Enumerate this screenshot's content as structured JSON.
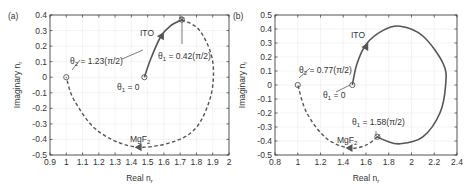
{
  "chart_data": [
    {
      "panel": "(a)",
      "type": "line",
      "xlabel": "Real n_r",
      "ylabel": "Imaginary n_r",
      "xlim": [
        0.9,
        2.0
      ],
      "ylim": [
        -0.5,
        0.4
      ],
      "xticks": [
        "0.9",
        "1",
        "1.1",
        "1.2",
        "1.3",
        "1.4",
        "1.5",
        "1.6",
        "1.7",
        "1.8",
        "1.9",
        "2"
      ],
      "yticks": [
        "0.4",
        "0.3",
        "0.2",
        "0.1",
        "0",
        "-0.1",
        "-0.2",
        "-0.3",
        "-0.4",
        "-0.5"
      ],
      "grid": true,
      "series": [
        {
          "name": "ITO",
          "style": "solid",
          "points": [
            [
              1.48,
              0.0
            ],
            [
              1.52,
              0.12
            ],
            [
              1.58,
              0.26
            ],
            [
              1.64,
              0.33
            ],
            [
              1.71,
              0.37
            ]
          ]
        },
        {
          "name": "MgF2",
          "style": "dashed",
          "points": [
            [
              1.71,
              0.37
            ],
            [
              1.82,
              0.3
            ],
            [
              1.9,
              0.1
            ],
            [
              1.88,
              -0.15
            ],
            [
              1.75,
              -0.37
            ],
            [
              1.45,
              -0.45
            ],
            [
              1.2,
              -0.35
            ],
            [
              1.05,
              -0.15
            ],
            [
              1.0,
              0.0
            ]
          ]
        }
      ],
      "annotations": [
        {
          "text": "θ1 = 0",
          "x": 1.48,
          "y": 0.0
        },
        {
          "text": "θ1 = 0.42(π/2)",
          "x": 1.71,
          "y": 0.37
        },
        {
          "text": "θ2 = 1.23(π/2)",
          "x": 1.0,
          "y": 0.0
        },
        {
          "text": "ITO",
          "x": 1.58,
          "y": 0.27
        },
        {
          "text": "MgF2",
          "x": 1.43,
          "y": -0.45
        }
      ]
    },
    {
      "panel": "(b)",
      "type": "line",
      "xlabel": "Real n_r",
      "ylabel": "Imaginary n_r",
      "xlim": [
        0.8,
        2.4
      ],
      "ylim": [
        -0.5,
        0.5
      ],
      "xticks": [
        "0.8",
        "1",
        "1.2",
        "1.4",
        "1.6",
        "1.8",
        "2",
        "2.2",
        "2.4"
      ],
      "yticks": [
        "0.5",
        "0.4",
        "0.3",
        "0.2",
        "0.1",
        "0",
        "-0.1",
        "-0.2",
        "-0.3",
        "-0.4",
        "-0.5"
      ],
      "grid": true,
      "series": [
        {
          "name": "ITO",
          "style": "solid",
          "points": [
            [
              1.48,
              0.0
            ],
            [
              1.52,
              0.15
            ],
            [
              1.6,
              0.29
            ],
            [
              1.75,
              0.39
            ],
            [
              1.9,
              0.42
            ],
            [
              2.1,
              0.35
            ],
            [
              2.28,
              0.15
            ],
            [
              2.3,
              0.0
            ],
            [
              2.25,
              -0.2
            ],
            [
              2.1,
              -0.37
            ],
            [
              1.9,
              -0.42
            ],
            [
              1.78,
              -0.4
            ],
            [
              1.7,
              -0.37
            ]
          ]
        },
        {
          "name": "MgF2",
          "style": "dashed",
          "points": [
            [
              1.7,
              -0.37
            ],
            [
              1.6,
              -0.43
            ],
            [
              1.45,
              -0.45
            ],
            [
              1.25,
              -0.38
            ],
            [
              1.08,
              -0.2
            ],
            [
              1.0,
              0.0
            ]
          ]
        }
      ],
      "annotations": [
        {
          "text": "θ1 = 0",
          "x": 1.48,
          "y": 0.0
        },
        {
          "text": "θ1 = 1.58(π/2)",
          "x": 1.7,
          "y": -0.37
        },
        {
          "text": "θ2 = 0.77(π/2)",
          "x": 1.0,
          "y": 0.0
        },
        {
          "text": "ITO",
          "x": 1.6,
          "y": 0.29
        },
        {
          "text": "MgF2",
          "x": 1.45,
          "y": -0.45
        }
      ]
    }
  ],
  "panels": {
    "a": {
      "label": "(a)",
      "xlabel_main": "Real n",
      "xlabel_sub": "r",
      "ylabel_main": "Imaginary n",
      "ylabel_sub": "r",
      "ann_theta1_zero": "θ",
      "ann_theta1_zero_sub": "1",
      "ann_theta1_zero_val": " = 0",
      "ann_theta1_end": "θ",
      "ann_theta1_end_sub": "1",
      "ann_theta1_end_val": " = 0.42(π/2)",
      "ann_theta2": "θ",
      "ann_theta2_sub": "2",
      "ann_theta2_val": " = 1.23(π/2)",
      "ito": "ITO",
      "mgf": "MgF",
      "mgf_sub": "2"
    },
    "b": {
      "label": "(b)",
      "xlabel_main": "Real n",
      "xlabel_sub": "r",
      "ylabel_main": "Imaginary n",
      "ylabel_sub": "r",
      "ann_theta1_zero": "θ",
      "ann_theta1_zero_sub": "1",
      "ann_theta1_zero_val": " = 0",
      "ann_theta1_end": "θ",
      "ann_theta1_end_sub": "1",
      "ann_theta1_end_val": " = 1.58(π/2)",
      "ann_theta2": "θ",
      "ann_theta2_sub": "2",
      "ann_theta2_val": " = 0.77(π/2)",
      "ito": "ITO",
      "mgf": "MgF",
      "mgf_sub": "2"
    }
  },
  "colors": {
    "curve": "#555555",
    "axis": "#333333",
    "grid": "#ececec"
  }
}
